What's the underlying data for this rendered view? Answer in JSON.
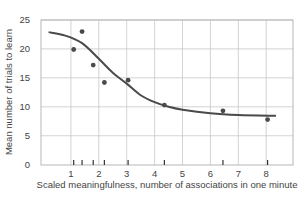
{
  "chart_data": {
    "type": "scatter",
    "title": "",
    "xlabel": "Scaled meaningfulness, number of associations in one minute",
    "ylabel": "Mean number of trials to learn",
    "xlim": [
      0,
      9
    ],
    "ylim": [
      0,
      25
    ],
    "x_ticks": [
      1,
      2,
      3,
      4,
      5,
      6,
      7,
      8
    ],
    "y_ticks": [
      0,
      5,
      10,
      15,
      20,
      25
    ],
    "grid": true,
    "legend": null,
    "series": [
      {
        "name": "Observed data",
        "kind": "scatter",
        "points": [
          {
            "x": 1.1,
            "y": 19.9
          },
          {
            "x": 1.4,
            "y": 23.0
          },
          {
            "x": 1.8,
            "y": 17.2
          },
          {
            "x": 2.2,
            "y": 14.2
          },
          {
            "x": 3.05,
            "y": 14.6
          },
          {
            "x": 4.35,
            "y": 10.3
          },
          {
            "x": 6.45,
            "y": 9.3
          },
          {
            "x": 8.05,
            "y": 7.8
          }
        ]
      },
      {
        "name": "Fitted curve",
        "kind": "line",
        "points": [
          {
            "x": 0.2,
            "y": 22.9
          },
          {
            "x": 0.8,
            "y": 22.3
          },
          {
            "x": 1.4,
            "y": 21.0
          },
          {
            "x": 2.0,
            "y": 18.3
          },
          {
            "x": 2.5,
            "y": 15.9
          },
          {
            "x": 3.0,
            "y": 14.0
          },
          {
            "x": 3.5,
            "y": 12.0
          },
          {
            "x": 4.0,
            "y": 10.8
          },
          {
            "x": 4.5,
            "y": 10.0
          },
          {
            "x": 5.0,
            "y": 9.5
          },
          {
            "x": 6.0,
            "y": 8.9
          },
          {
            "x": 7.0,
            "y": 8.6
          },
          {
            "x": 8.35,
            "y": 8.45
          }
        ]
      }
    ],
    "rug_marks_x": [
      1.1,
      1.4,
      1.8,
      2.2,
      3.05,
      4.35,
      6.45,
      8.05
    ]
  },
  "style": {
    "curve_color": "#4a4a4a",
    "point_color": "#4a4a4a",
    "grid_color": "#c8c8c8",
    "axis_color": "#b0b0b0",
    "text_color": "#444444"
  }
}
